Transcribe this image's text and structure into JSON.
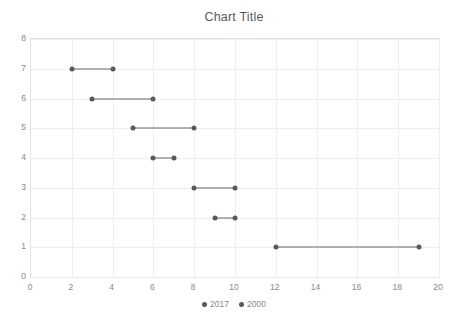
{
  "chart_data": {
    "type": "line",
    "title": "Chart Title",
    "xlabel": "",
    "ylabel": "",
    "xlim": [
      0,
      20
    ],
    "ylim": [
      0,
      8
    ],
    "x_ticks": [
      0,
      2,
      4,
      6,
      8,
      10,
      12,
      14,
      16,
      18,
      20
    ],
    "y_ticks": [
      0,
      1,
      2,
      3,
      4,
      5,
      6,
      7,
      8
    ],
    "grid": true,
    "legend_position": "bottom",
    "series": [
      {
        "name": "2017",
        "marker_color": "#595959"
      },
      {
        "name": "2000",
        "marker_color": "#595959"
      }
    ],
    "ranges": [
      {
        "category": 7,
        "start": 2,
        "end": 4
      },
      {
        "category": 6,
        "start": 3,
        "end": 6
      },
      {
        "category": 5,
        "start": 5,
        "end": 8
      },
      {
        "category": 4,
        "start": 6,
        "end": 7
      },
      {
        "category": 3,
        "start": 8,
        "end": 10
      },
      {
        "category": 2,
        "start": 9,
        "end": 10
      },
      {
        "category": 1,
        "start": 12,
        "end": 19
      }
    ]
  },
  "colors": {
    "marker": "#595959",
    "line": "#6b6b6b",
    "grid": "#eeeeee",
    "axis_text": "#888888",
    "title_text": "#595959",
    "background": "#ffffff"
  }
}
